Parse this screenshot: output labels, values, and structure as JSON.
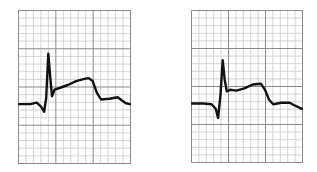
{
  "chart_data": [
    {
      "type": "line",
      "title": "",
      "description": "ECG tracing on grid paper, panel A: ST-segment elevation after QRS complex",
      "grid": {
        "minor_cells_x": 15,
        "minor_cells_y": 20,
        "major_every": 5
      },
      "xlabel": "",
      "ylabel": "",
      "points": [
        [
          0,
          12.3
        ],
        [
          3,
          12.3
        ],
        [
          4.5,
          12.1
        ],
        [
          5.5,
          12.6
        ],
        [
          6.3,
          13.3
        ],
        [
          6.8,
          11.5
        ],
        [
          7.3,
          5.7
        ],
        [
          7.8,
          9.0
        ],
        [
          8.2,
          11.3
        ],
        [
          8.8,
          10.4
        ],
        [
          10,
          10.2
        ],
        [
          12,
          9.8
        ],
        [
          14,
          9.3
        ],
        [
          16,
          9.0
        ],
        [
          17,
          8.9
        ],
        [
          18,
          9.3
        ],
        [
          19,
          10.8
        ],
        [
          20,
          11.7
        ],
        [
          22,
          11.6
        ],
        [
          24,
          11.4
        ],
        [
          25,
          11.8
        ],
        [
          26,
          12.2
        ],
        [
          27,
          12.3
        ]
      ]
    },
    {
      "type": "line",
      "title": "",
      "description": "ECG tracing on grid paper, panel B: ST-segment elevation after QRS complex",
      "grid": {
        "minor_cells_x": 15,
        "minor_cells_y": 20,
        "major_every": 5
      },
      "xlabel": "",
      "ylabel": "",
      "points": [
        [
          0,
          12.3
        ],
        [
          3,
          12.3
        ],
        [
          5,
          12.4
        ],
        [
          6,
          13.0
        ],
        [
          6.6,
          14.2
        ],
        [
          7.2,
          11.0
        ],
        [
          7.7,
          6.6
        ],
        [
          8.2,
          9.2
        ],
        [
          8.7,
          10.7
        ],
        [
          9.5,
          10.5
        ],
        [
          11,
          10.6
        ],
        [
          13,
          10.3
        ],
        [
          15,
          9.8
        ],
        [
          17,
          9.7
        ],
        [
          18,
          10.5
        ],
        [
          19,
          11.8
        ],
        [
          20,
          12.4
        ],
        [
          22,
          12.2
        ],
        [
          24,
          12.2
        ],
        [
          25,
          12.5
        ],
        [
          27,
          13.0
        ]
      ]
    }
  ],
  "colors": {
    "minor_grid": "#c8c8c8",
    "major_grid": "#8a8a8a",
    "trace": "#111111",
    "background": "#ffffff"
  },
  "panels": [
    {
      "left": 18,
      "top": 10,
      "width": 112,
      "height": 153
    },
    {
      "left": 191,
      "top": 10,
      "width": 111,
      "height": 152
    }
  ]
}
